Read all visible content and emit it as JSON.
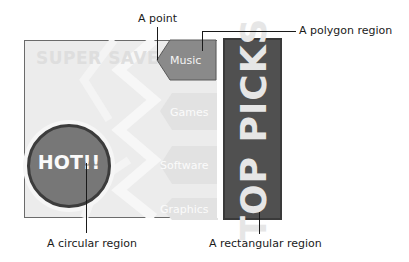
{
  "callouts": {
    "point": "A point",
    "polygon": "A polygon region",
    "circle": "A circular region",
    "rectangle": "A rectangular region"
  },
  "image_map": {
    "background_text": "SUPER SAVER!",
    "circle_label": "HOT!!",
    "banner_label": "TOP PICKS",
    "menu_items": [
      {
        "label": "Music",
        "state": "active"
      },
      {
        "label": "Games",
        "state": "faded"
      },
      {
        "label": "Software",
        "state": "faded"
      },
      {
        "label": "Graphics",
        "state": "faded"
      }
    ]
  },
  "colors": {
    "banner": "#505050",
    "circle": "#777777",
    "active_item": "#8a8a8a",
    "faded_item": "#e2e2e2",
    "frame_bg": "#ececec"
  }
}
